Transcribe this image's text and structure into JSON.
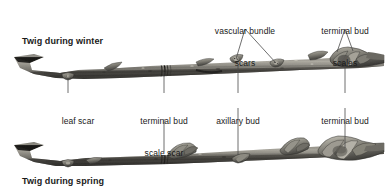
{
  "figure": {
    "background": "#ffffff",
    "line_color": "#4a4a4a",
    "text_color": "#1a1a1a"
  },
  "headings": [
    {
      "id": "winter",
      "text": "Twig during winter",
      "x": 22,
      "y": 36
    },
    {
      "id": "spring",
      "text": "Twig during spring",
      "x": 22,
      "y": 178
    }
  ],
  "callouts": {
    "top": [
      {
        "id": "vascular-bundle-scars",
        "line1": "vascular bundle",
        "line2": "scars",
        "label_x": 245,
        "label_y": 6,
        "fork_x": 245,
        "fork_y": 29,
        "targets": [
          {
            "x": 236,
            "y": 59
          },
          {
            "x": 276,
            "y": 63
          }
        ]
      },
      {
        "id": "terminal-bud-scales",
        "line1": "terminal bud",
        "line2": "scales",
        "label_x": 345,
        "label_y": 6,
        "fork_x": 345,
        "fork_y": 29,
        "targets": [
          {
            "x": 337,
            "y": 52
          },
          {
            "x": 353,
            "y": 51
          }
        ]
      }
    ],
    "bottom": [
      {
        "id": "leaf-scar",
        "line1": "leaf scar",
        "line2": "",
        "label_x": 78,
        "label_y": 96,
        "leader_x": 68,
        "leader_top": 78,
        "leader_bottom": 93,
        "leader_down_top": null,
        "leader_down_bottom": null
      },
      {
        "id": "terminal-bud-scale-scar",
        "line1": "terminal bud",
        "line2": "scale scar",
        "label_x": 164,
        "label_y": 96,
        "leader_x": 164,
        "leader_top": 72,
        "leader_bottom": 93,
        "leader_down_top": 119,
        "leader_down_bottom": 152
      },
      {
        "id": "axillary-bud",
        "line1": "axillary bud",
        "line2": "",
        "label_x": 238,
        "label_y": 96,
        "leader_x": 238,
        "leader_top": 68,
        "leader_bottom": 93,
        "leader_down_top": 108,
        "leader_down_bottom": 148
      },
      {
        "id": "terminal-bud",
        "line1": "terminal bud",
        "line2": "",
        "label_x": 345,
        "label_y": 96,
        "leader_x": 345,
        "leader_top": 60,
        "leader_bottom": 93,
        "leader_down_top": 108,
        "leader_down_bottom": 148
      }
    ]
  },
  "specimens": [
    {
      "id": "winter-twig",
      "caption_ref": "winter",
      "y_center": 64,
      "x_start": 14,
      "x_end": 384
    },
    {
      "id": "spring-twig",
      "caption_ref": "spring",
      "y_center": 152,
      "x_start": 14,
      "x_end": 384
    }
  ]
}
